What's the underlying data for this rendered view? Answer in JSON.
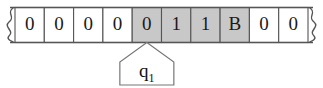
{
  "diagram": {
    "kind": "turing-machine-tape",
    "title": "",
    "tape": {
      "left_end_marker": "squiggle",
      "right_end_marker": "squiggle",
      "cells": [
        {
          "index": 0,
          "symbol": "0",
          "highlighted": false
        },
        {
          "index": 1,
          "symbol": "0",
          "highlighted": false
        },
        {
          "index": 2,
          "symbol": "0",
          "highlighted": false
        },
        {
          "index": 3,
          "symbol": "0",
          "highlighted": false
        },
        {
          "index": 4,
          "symbol": "0",
          "highlighted": true
        },
        {
          "index": 5,
          "symbol": "1",
          "highlighted": true
        },
        {
          "index": 6,
          "symbol": "1",
          "highlighted": true
        },
        {
          "index": 7,
          "symbol": "B",
          "highlighted": true
        },
        {
          "index": 8,
          "symbol": "0",
          "highlighted": false
        },
        {
          "index": 9,
          "symbol": "0",
          "highlighted": false
        }
      ]
    },
    "head": {
      "at_cell_index": 4,
      "state_base": "q",
      "state_subscript": "1"
    },
    "colors": {
      "highlight_fill": "#c8c8c8",
      "cell_fill": "#ffffff",
      "border": "#555555",
      "text": "#1a1a1a",
      "pointer_border": "#777777"
    }
  }
}
